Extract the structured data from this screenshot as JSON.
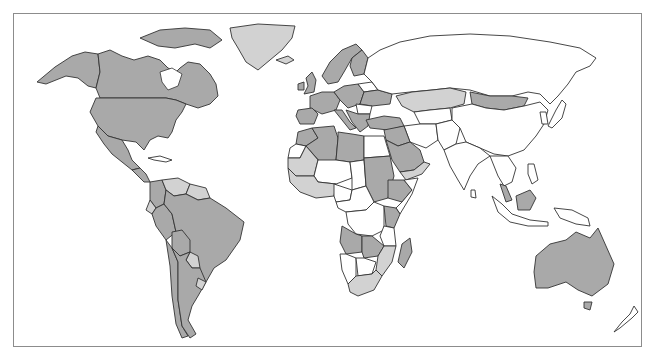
{
  "map": {
    "type": "world-choropleth",
    "legend": null,
    "classes": {
      "high": {
        "color": "#a9a9a9"
      },
      "medium": {
        "color": "#d2d2d2"
      },
      "none": {
        "color": "#ffffff"
      }
    },
    "regions": [
      {
        "name": "canada",
        "class": "high"
      },
      {
        "name": "alaska",
        "class": "high"
      },
      {
        "name": "greenland",
        "class": "medium"
      },
      {
        "name": "usa",
        "class": "high"
      },
      {
        "name": "mexico",
        "class": "high"
      },
      {
        "name": "central-america",
        "class": "high"
      },
      {
        "name": "cuba",
        "class": "none"
      },
      {
        "name": "venezuela",
        "class": "medium"
      },
      {
        "name": "colombia",
        "class": "high"
      },
      {
        "name": "ecuador",
        "class": "medium"
      },
      {
        "name": "peru",
        "class": "high"
      },
      {
        "name": "brazil",
        "class": "high"
      },
      {
        "name": "bolivia",
        "class": "high"
      },
      {
        "name": "paraguay",
        "class": "medium"
      },
      {
        "name": "argentina",
        "class": "high"
      },
      {
        "name": "chile",
        "class": "high"
      },
      {
        "name": "uruguay",
        "class": "medium"
      },
      {
        "name": "guianas",
        "class": "medium"
      },
      {
        "name": "iceland",
        "class": "medium"
      },
      {
        "name": "uk",
        "class": "high"
      },
      {
        "name": "ireland",
        "class": "high"
      },
      {
        "name": "scandinavia",
        "class": "high"
      },
      {
        "name": "finland",
        "class": "high"
      },
      {
        "name": "western-europe",
        "class": "high"
      },
      {
        "name": "iberia",
        "class": "high"
      },
      {
        "name": "italy",
        "class": "high"
      },
      {
        "name": "central-europe",
        "class": "high"
      },
      {
        "name": "belarus",
        "class": "none"
      },
      {
        "name": "ukraine",
        "class": "high"
      },
      {
        "name": "balkans",
        "class": "high"
      },
      {
        "name": "romania",
        "class": "none"
      },
      {
        "name": "turkey",
        "class": "high"
      },
      {
        "name": "russia",
        "class": "none"
      },
      {
        "name": "kazakhstan",
        "class": "medium"
      },
      {
        "name": "mongolia",
        "class": "high"
      },
      {
        "name": "china",
        "class": "none"
      },
      {
        "name": "central-asia",
        "class": "none"
      },
      {
        "name": "iran",
        "class": "none"
      },
      {
        "name": "afghanistan-pakistan",
        "class": "none"
      },
      {
        "name": "india",
        "class": "none"
      },
      {
        "name": "southeast-asia",
        "class": "none"
      },
      {
        "name": "malaysia",
        "class": "high"
      },
      {
        "name": "indonesia",
        "class": "none"
      },
      {
        "name": "borneo-malaysia",
        "class": "high"
      },
      {
        "name": "philippines",
        "class": "none"
      },
      {
        "name": "japan",
        "class": "none"
      },
      {
        "name": "korea",
        "class": "none"
      },
      {
        "name": "papua",
        "class": "none"
      },
      {
        "name": "saudi-arabia",
        "class": "high"
      },
      {
        "name": "yemen-oman",
        "class": "medium"
      },
      {
        "name": "iraq-syria",
        "class": "high"
      },
      {
        "name": "morocco",
        "class": "high"
      },
      {
        "name": "algeria",
        "class": "high"
      },
      {
        "name": "libya",
        "class": "high"
      },
      {
        "name": "egypt",
        "class": "none"
      },
      {
        "name": "western-sahara",
        "class": "none"
      },
      {
        "name": "mauritania",
        "class": "medium"
      },
      {
        "name": "mali-niger",
        "class": "none"
      },
      {
        "name": "chad",
        "class": "none"
      },
      {
        "name": "sudan",
        "class": "high"
      },
      {
        "name": "ethiopia",
        "class": "high"
      },
      {
        "name": "somalia",
        "class": "none"
      },
      {
        "name": "west-africa",
        "class": "medium"
      },
      {
        "name": "nigeria",
        "class": "none"
      },
      {
        "name": "central-africa",
        "class": "none"
      },
      {
        "name": "drc",
        "class": "none"
      },
      {
        "name": "kenya",
        "class": "high"
      },
      {
        "name": "tanzania",
        "class": "none"
      },
      {
        "name": "angola",
        "class": "high"
      },
      {
        "name": "zambia",
        "class": "high"
      },
      {
        "name": "mozambique",
        "class": "medium"
      },
      {
        "name": "namibia",
        "class": "none"
      },
      {
        "name": "botswana",
        "class": "none"
      },
      {
        "name": "south-africa",
        "class": "medium"
      },
      {
        "name": "madagascar",
        "class": "high"
      },
      {
        "name": "australia",
        "class": "high"
      },
      {
        "name": "tasmania",
        "class": "high"
      },
      {
        "name": "new-zealand",
        "class": "none"
      },
      {
        "name": "sri-lanka",
        "class": "none"
      }
    ]
  }
}
